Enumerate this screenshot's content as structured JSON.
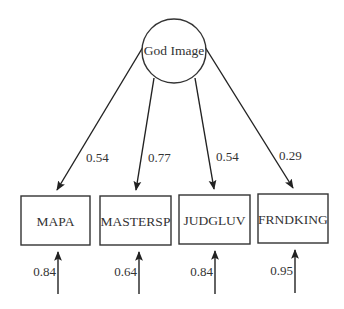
{
  "diagram": {
    "type": "structural-equation-model",
    "latent": {
      "label": "God Image",
      "cx": 174,
      "cy": 51,
      "r": 32
    },
    "indicators": [
      {
        "label": "MAPA",
        "x": 21,
        "y": 196,
        "w": 69,
        "h": 49,
        "loading": "0.54",
        "error": "0.84"
      },
      {
        "label": "MASTERSP",
        "x": 100,
        "y": 196,
        "w": 71,
        "h": 49,
        "loading": "0.77",
        "error": "0.64"
      },
      {
        "label": "JUDGLUV",
        "x": 179,
        "y": 195,
        "w": 71,
        "h": 49,
        "loading": "0.54",
        "error": "0.84"
      },
      {
        "label": "FRNDKING",
        "x": 258,
        "y": 194,
        "w": 70,
        "h": 49,
        "loading": "0.29",
        "error": "0.95"
      }
    ]
  }
}
